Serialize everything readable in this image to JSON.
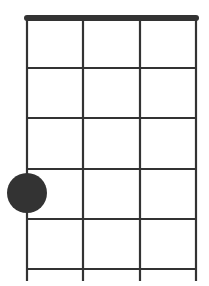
{
  "diagram": {
    "type": "chord-fretboard",
    "strings": 4,
    "frets": 5,
    "line_color": "#333333",
    "nut_color": "#333333",
    "dot_color": "#333333",
    "string_x": [
      27,
      83,
      140,
      196
    ],
    "nut_y": 18,
    "fret_y": [
      68,
      118,
      169,
      219,
      269
    ],
    "string_bottom_y": 281,
    "dots": [
      {
        "string": 1,
        "fret": 4,
        "cx": 27,
        "cy": 193,
        "r": 20
      }
    ]
  }
}
